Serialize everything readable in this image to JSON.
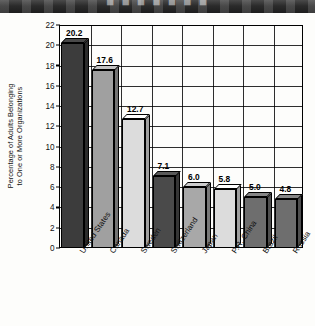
{
  "header": {
    "band_text": "■ ■ ■ ■ ■ ■ ■"
  },
  "chart_data": {
    "type": "bar",
    "title": "",
    "xlabel": "",
    "ylabel": "Percentage of Adults Belonging to One or More Organizations",
    "ylabel_line1": "Percentage of Adults Belonging",
    "ylabel_line2": "to One or More Organizations",
    "categories": [
      "United States",
      "Canada",
      "Sweden",
      "Switzerland",
      "Japan",
      "P.R. China",
      "Brazil",
      "Russia"
    ],
    "values": [
      20.2,
      17.6,
      12.7,
      7.1,
      6.0,
      5.8,
      5.0,
      4.8
    ],
    "value_labels": [
      "20.2",
      "17.6",
      "12.7",
      "7.1",
      "6.0",
      "5.8",
      "5.0",
      "4.8"
    ],
    "bar_colors": [
      "#3c3c3c",
      "#a0a0a0",
      "#dcdcdc",
      "#4a4a4a",
      "#a8a8a8",
      "#dcdcdc",
      "#6e6e6e",
      "#6e6e6e"
    ],
    "ylim": [
      0,
      22
    ],
    "ytick_values": [
      0,
      2,
      4,
      6,
      8,
      10,
      12,
      14,
      16,
      18,
      20,
      22
    ],
    "ytick_labels": [
      "0",
      "2",
      "4",
      "6",
      "8",
      "10",
      "12",
      "14",
      "16",
      "18",
      "20",
      "22"
    ],
    "grid": true,
    "grid_vertical_count": 8,
    "legend": null,
    "three_d": true
  }
}
